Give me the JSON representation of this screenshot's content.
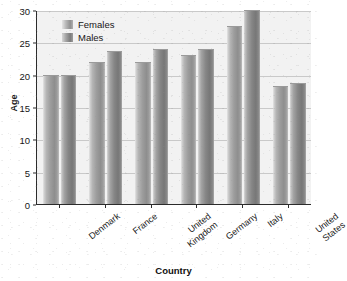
{
  "chart_data": {
    "type": "bar",
    "title": "",
    "xlabel": "Country",
    "ylabel": "Age",
    "categories": [
      "Denmark",
      "France",
      "United Kingdom",
      "Germany",
      "Italy",
      "United States"
    ],
    "category_lines": [
      [
        "Denmark"
      ],
      [
        "France"
      ],
      [
        "United",
        "Kingdom"
      ],
      [
        "Germany"
      ],
      [
        "Italy"
      ],
      [
        "United",
        "States"
      ]
    ],
    "series": [
      {
        "name": "Females",
        "values": [
          20,
          22,
          22,
          23,
          27.5,
          18.2
        ],
        "color": "#9d9d9d"
      },
      {
        "name": "Males",
        "values": [
          20,
          23.7,
          24,
          24,
          30,
          18.7
        ],
        "color": "#868686"
      }
    ],
    "ylim": [
      0,
      30
    ],
    "yticks": [
      0,
      5,
      10,
      15,
      20,
      25,
      30
    ],
    "ytick_labels": [
      "0",
      "5",
      "10",
      "15",
      "20",
      "25",
      "30"
    ],
    "grid": true,
    "grid_axis": "y",
    "legend_position": "upper-left",
    "bar_style": "vertical-gradient-grayscale"
  },
  "legend": {
    "entries": [
      {
        "label": "Females",
        "swatch": "female"
      },
      {
        "label": "Males",
        "swatch": "male"
      }
    ]
  },
  "axes": {
    "y_title": "Age",
    "x_title": "Country"
  },
  "colors": {
    "plot_background": "#f2f2f2",
    "gridline": "#c9c9c9",
    "axis": "#2b2b2b",
    "text": "#161616",
    "page_background": "#ffffff"
  }
}
